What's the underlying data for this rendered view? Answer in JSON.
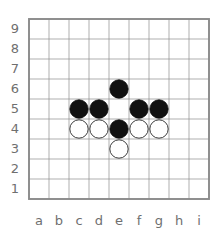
{
  "board": {
    "title": "Go board 9x9",
    "size": 9,
    "column_labels": [
      "a",
      "b",
      "c",
      "d",
      "e",
      "f",
      "g",
      "h",
      "i"
    ],
    "row_labels": [
      "9",
      "8",
      "7",
      "6",
      "5",
      "4",
      "3",
      "2",
      "1"
    ],
    "grid_color": "#8d8d8d",
    "border_color": "#8a8a8a",
    "label_color": "#6f6f6f",
    "background_color": "#ffffff",
    "geometry": {
      "origin_x": 29,
      "origin_y": 19,
      "cell": 20,
      "stone_radius": 9.2,
      "col_label_y": 221,
      "row_label_x": 15
    },
    "stones": [
      {
        "col": "e",
        "row": "6",
        "color": "black",
        "fill": "#111111"
      },
      {
        "col": "c",
        "row": "5",
        "color": "black",
        "fill": "#111111"
      },
      {
        "col": "d",
        "row": "5",
        "color": "black",
        "fill": "#111111"
      },
      {
        "col": "f",
        "row": "5",
        "color": "black",
        "fill": "#111111"
      },
      {
        "col": "g",
        "row": "5",
        "color": "black",
        "fill": "#111111"
      },
      {
        "col": "c",
        "row": "4",
        "color": "white",
        "fill": "#ffffff"
      },
      {
        "col": "d",
        "row": "4",
        "color": "white",
        "fill": "#ffffff"
      },
      {
        "col": "e",
        "row": "4",
        "color": "black",
        "fill": "#111111"
      },
      {
        "col": "f",
        "row": "4",
        "color": "white",
        "fill": "#ffffff"
      },
      {
        "col": "g",
        "row": "4",
        "color": "white",
        "fill": "#ffffff"
      },
      {
        "col": "e",
        "row": "3",
        "color": "white",
        "fill": "#ffffff"
      }
    ]
  }
}
